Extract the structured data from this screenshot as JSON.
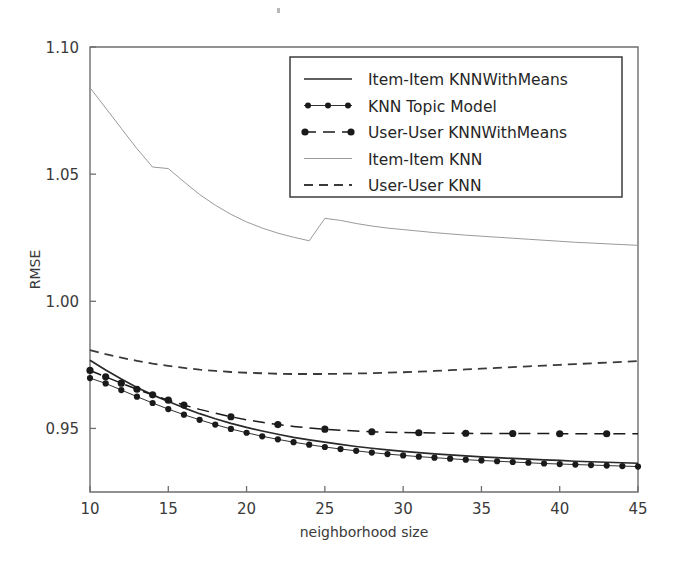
{
  "figure": {
    "background_color": "#ffffff",
    "axes_color": "#6e6e6e",
    "text_color": "#3a3a3a"
  },
  "chart_data": {
    "type": "line",
    "title": "",
    "xlabel": "neighborhood size",
    "ylabel": "RMSE",
    "xlim": [
      10,
      45
    ],
    "ylim": [
      0.925,
      1.1
    ],
    "xticks": [
      10,
      15,
      20,
      25,
      30,
      35,
      40,
      45
    ],
    "xtick_labels": [
      "10",
      "15",
      "20",
      "25",
      "30",
      "35",
      "40",
      "45"
    ],
    "yticks": [
      0.95,
      1.0,
      1.05,
      1.1
    ],
    "ytick_labels": [
      "0.95",
      "1.00",
      "1.05",
      "1.10"
    ],
    "grid": false,
    "legend_position": "upper center",
    "x": [
      10,
      11,
      12,
      13,
      14,
      15,
      16,
      17,
      18,
      19,
      20,
      21,
      22,
      23,
      24,
      25,
      26,
      27,
      28,
      29,
      30,
      31,
      32,
      33,
      34,
      35,
      36,
      37,
      38,
      39,
      40,
      41,
      42,
      43,
      44,
      45
    ],
    "series": [
      {
        "name": "Item-Item KNNWithMeans",
        "style": "solid",
        "marker": "none",
        "color": "#2a2a2a",
        "values": [
          0.9768,
          0.973,
          0.9694,
          0.9661,
          0.9632,
          0.9606,
          0.9581,
          0.9558,
          0.9538,
          0.952,
          0.9504,
          0.949,
          0.9477,
          0.9465,
          0.9455,
          0.9446,
          0.9437,
          0.9429,
          0.9422,
          0.9416,
          0.941,
          0.9405,
          0.94,
          0.9396,
          0.9392,
          0.9388,
          0.9385,
          0.9382,
          0.9379,
          0.9376,
          0.9374,
          0.9371,
          0.9369,
          0.9367,
          0.9365,
          0.9363
        ]
      },
      {
        "name": "KNN Topic Model",
        "style": "solid-thin",
        "marker": "circle",
        "color": "#1a1a1a",
        "values": [
          0.9698,
          0.9677,
          0.9651,
          0.9625,
          0.96,
          0.9576,
          0.9554,
          0.9534,
          0.9515,
          0.9498,
          0.9483,
          0.9469,
          0.9457,
          0.9446,
          0.9436,
          0.9427,
          0.9419,
          0.9412,
          0.9405,
          0.9399,
          0.9394,
          0.9389,
          0.9385,
          0.9381,
          0.9377,
          0.9374,
          0.9371,
          0.9368,
          0.9365,
          0.9362,
          0.936,
          0.9358,
          0.9356,
          0.9354,
          0.9352,
          0.935
        ]
      },
      {
        "name": "User-User KNNWithMeans",
        "style": "dashdot",
        "marker": "circle-large",
        "color": "#1a1a1a",
        "values": [
          0.9728,
          0.9703,
          0.9678,
          0.9654,
          0.9632,
          0.9611,
          0.9592,
          0.9575,
          0.956,
          0.9546,
          0.9534,
          0.9524,
          0.9515,
          0.9508,
          0.9502,
          0.9497,
          0.9493,
          0.949,
          0.9487,
          0.9485,
          0.9484,
          0.9483,
          0.9482,
          0.9481,
          0.9481,
          0.948,
          0.948,
          0.948,
          0.948,
          0.948,
          0.9479,
          0.9479,
          0.9479,
          0.9479,
          0.9479,
          0.9479
        ]
      },
      {
        "name": "Item-Item KNN",
        "style": "solid-light",
        "marker": "none",
        "color": "#9a9a9a",
        "values": [
          1.084,
          1.076,
          1.068,
          1.06,
          1.0528,
          1.0522,
          1.047,
          1.042,
          1.0378,
          1.0342,
          1.0312,
          1.0288,
          1.0268,
          1.0252,
          1.0238,
          1.0326,
          1.0318,
          1.0306,
          1.0296,
          1.0288,
          1.0282,
          1.0276,
          1.027,
          1.0265,
          1.026,
          1.0256,
          1.0252,
          1.0248,
          1.0244,
          1.024,
          1.0236,
          1.0232,
          1.0229,
          1.0226,
          1.0223,
          1.022
        ]
      },
      {
        "name": "User-User KNN",
        "style": "dashed",
        "marker": "none",
        "color": "#3a3a3a",
        "values": [
          0.9808,
          0.9792,
          0.9778,
          0.9766,
          0.9755,
          0.9746,
          0.9738,
          0.9731,
          0.9726,
          0.9722,
          0.9719,
          0.9717,
          0.9715,
          0.9714,
          0.9714,
          0.9714,
          0.9715,
          0.9716,
          0.9717,
          0.9719,
          0.9721,
          0.9723,
          0.9726,
          0.9729,
          0.9732,
          0.9735,
          0.9738,
          0.9741,
          0.9744,
          0.9747,
          0.975,
          0.9753,
          0.9756,
          0.9759,
          0.9762,
          0.9765
        ]
      }
    ],
    "legend_entries": [
      {
        "label": "Item-Item KNNWithMeans",
        "style": "solid",
        "marker": "none",
        "color": "#2a2a2a"
      },
      {
        "label": "KNN Topic Model",
        "style": "solid-thin",
        "marker": "circle",
        "color": "#1a1a1a"
      },
      {
        "label": "User-User KNNWithMeans",
        "style": "dashdot",
        "marker": "circle-large",
        "color": "#1a1a1a"
      },
      {
        "label": "Item-Item KNN",
        "style": "solid-light",
        "marker": "none",
        "color": "#9a9a9a"
      },
      {
        "label": "User-User KNN",
        "style": "dashed",
        "marker": "none",
        "color": "#3a3a3a"
      }
    ]
  }
}
